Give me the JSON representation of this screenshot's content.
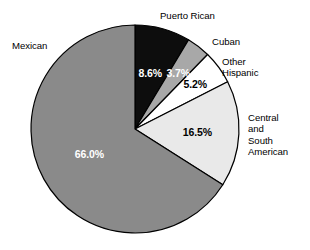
{
  "chart_data": {
    "type": "pie",
    "title": "",
    "subtitle": "",
    "xlabel": "",
    "ylabel": "",
    "legend_position": "callout-labels",
    "grid": false,
    "start_angle_deg": 0,
    "direction": "clockwise",
    "categories": [
      "Puerto Rican",
      "Cuban",
      "Other Hispanic",
      "Central and South American",
      "Mexican"
    ],
    "values": [
      8.6,
      3.7,
      5.2,
      16.5,
      66.0
    ],
    "value_labels": [
      "8.6%",
      "3.7%",
      "5.2%",
      "16.5%",
      "66.0%"
    ],
    "colors": [
      "#0d0d0d",
      "#a8a8a8",
      "#ffffff",
      "#e9e9e9",
      "#8a8a8a"
    ],
    "slices": [
      {
        "name": "Puerto Rican",
        "value": 8.6,
        "value_label": "8.6%",
        "fill": "#0d0d0d",
        "value_text_color": "#ffffff",
        "label_text": "Puerto Rican"
      },
      {
        "name": "Cuban",
        "value": 3.7,
        "value_label": "3.7%",
        "fill": "#a8a8a8",
        "value_text_color": "#ffffff",
        "label_text": "Cuban"
      },
      {
        "name": "Other Hispanic",
        "value": 5.2,
        "value_label": "5.2%",
        "fill": "#ffffff",
        "value_text_color": "#000000",
        "label_text": "Other\nHispanic"
      },
      {
        "name": "Central and South American",
        "value": 16.5,
        "value_label": "16.5%",
        "fill": "#e9e9e9",
        "value_text_color": "#000000",
        "label_text": "Central\nand\nSouth\nAmerican"
      },
      {
        "name": "Mexican",
        "value": 66.0,
        "value_label": "66.0%",
        "fill": "#8a8a8a",
        "value_text_color": "#ffffff",
        "label_text": "Mexican"
      }
    ],
    "geometry": {
      "center_x": 135,
      "center_y": 129,
      "radius": 104,
      "stroke": "#000000",
      "stroke_width": 1.2
    }
  }
}
